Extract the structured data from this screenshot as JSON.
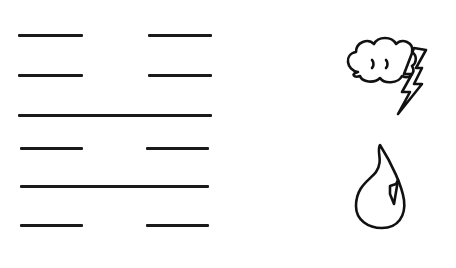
{
  "hexagram": {
    "number": 40,
    "name": "Jie (Deliverance)",
    "lines_top_to_bottom": [
      "broken",
      "broken",
      "solid",
      "broken",
      "solid",
      "broken"
    ],
    "line_y": [
      35,
      75,
      115,
      148,
      186,
      225
    ],
    "line_color": "#1a1a1a"
  },
  "trigrams": {
    "upper": {
      "name": "thunder",
      "icon": "thunder-cloud-icon"
    },
    "lower": {
      "name": "water",
      "icon": "water-drop-icon"
    }
  }
}
